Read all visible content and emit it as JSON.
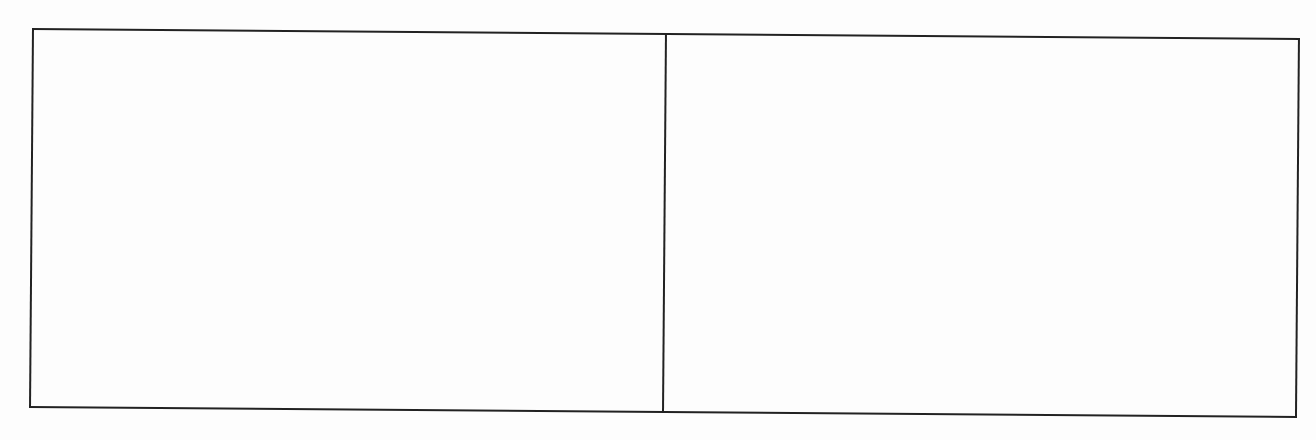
{
  "document": {
    "box": {
      "border_color": "#222222",
      "cells": [
        {
          "position": "left",
          "content": ""
        },
        {
          "position": "right",
          "content": ""
        }
      ]
    }
  }
}
